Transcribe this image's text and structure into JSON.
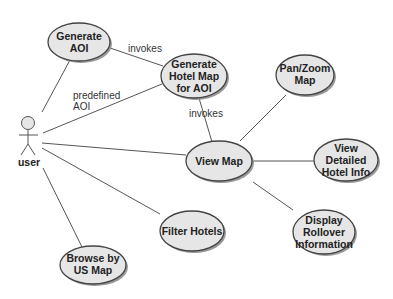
{
  "diagram": {
    "type": "uml-use-case",
    "actor": {
      "label": "user",
      "x": 28,
      "y": 122
    },
    "use_cases": [
      {
        "id": "generate_aoi",
        "lines": [
          "Generate",
          "AOI"
        ],
        "cx": 79,
        "cy": 42,
        "rx": 31,
        "ry": 19
      },
      {
        "id": "generate_hotel_map",
        "lines": [
          "Generate",
          "Hotel Map",
          "for AOI"
        ],
        "cx": 194,
        "cy": 76,
        "rx": 33,
        "ry": 22
      },
      {
        "id": "pan_zoom_map",
        "lines": [
          "Pan/Zoom",
          "Map"
        ],
        "cx": 305,
        "cy": 75,
        "rx": 29,
        "ry": 20
      },
      {
        "id": "view_map",
        "lines": [
          "View Map"
        ],
        "cx": 219,
        "cy": 161,
        "rx": 33,
        "ry": 20
      },
      {
        "id": "view_detailed_hotel_info",
        "lines": [
          "View",
          "Detailed",
          "Hotel Info"
        ],
        "cx": 346,
        "cy": 160,
        "rx": 32,
        "ry": 21
      },
      {
        "id": "display_rollover_information",
        "lines": [
          "Display",
          "Rollover",
          "Information"
        ],
        "cx": 324,
        "cy": 232,
        "rx": 31,
        "ry": 22
      },
      {
        "id": "filter_hotels",
        "lines": [
          "Filter Hotels"
        ],
        "cx": 192,
        "cy": 231,
        "rx": 32,
        "ry": 20
      },
      {
        "id": "browse_by_us_map",
        "lines": [
          "Browse by",
          "US Map"
        ],
        "cx": 93,
        "cy": 265,
        "rx": 33,
        "ry": 19
      }
    ],
    "edge_labels": {
      "invokes_1": "invokes",
      "predefined_line1": "predefined",
      "predefined_line2": "AOI",
      "invokes_2": "invokes"
    },
    "relationships": [
      {
        "from": "user",
        "to": "generate_aoi"
      },
      {
        "from": "user",
        "to": "generate_hotel_map",
        "label": "predefined AOI"
      },
      {
        "from": "user",
        "to": "view_map"
      },
      {
        "from": "user",
        "to": "filter_hotels"
      },
      {
        "from": "user",
        "to": "browse_by_us_map"
      },
      {
        "from": "generate_aoi",
        "to": "generate_hotel_map",
        "label": "invokes"
      },
      {
        "from": "generate_hotel_map",
        "to": "view_map",
        "label": "invokes"
      },
      {
        "from": "view_map",
        "to": "pan_zoom_map"
      },
      {
        "from": "view_map",
        "to": "view_detailed_hotel_info"
      },
      {
        "from": "view_map",
        "to": "display_rollover_information"
      }
    ]
  }
}
